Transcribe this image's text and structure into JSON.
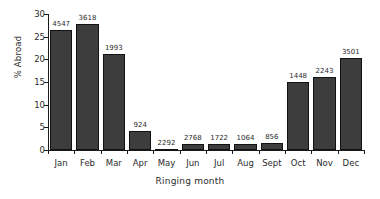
{
  "chart_data": {
    "type": "bar",
    "title": "",
    "xlabel": "Ringing month",
    "ylabel": "% Abroad",
    "categories": [
      "Jan",
      "Feb",
      "Mar",
      "Apr",
      "May",
      "Jun",
      "Jul",
      "Aug",
      "Sept",
      "Oct",
      "Nov",
      "Dec"
    ],
    "values": [
      26.5,
      27.7,
      21.2,
      4.3,
      0.3,
      1.4,
      1.4,
      1.3,
      1.6,
      15.0,
      16.0,
      20.3
    ],
    "point_labels": [
      "4547",
      "3618",
      "1993",
      "924",
      "2292",
      "2768",
      "1722",
      "1064",
      "856",
      "1448",
      "2243",
      "3501"
    ],
    "ylim": [
      0,
      30
    ],
    "yticks": [
      0,
      5,
      10,
      15,
      20,
      25,
      30
    ],
    "ytick_labels": [
      "0",
      "5",
      "10",
      "15",
      "20",
      "25",
      "30"
    ],
    "grid": false,
    "legend": "none",
    "bar_color": "#3d3d3d",
    "bar_edge_color": "#121212",
    "axis_color": "#1a1a1a",
    "background": "#ffffff"
  }
}
